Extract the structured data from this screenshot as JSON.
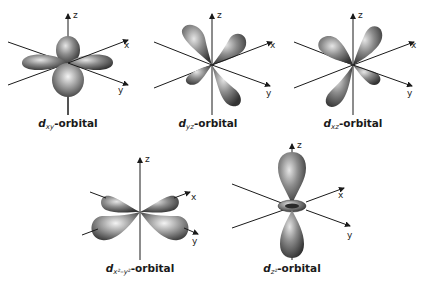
{
  "diagram": {
    "colors": {
      "lobe_dark": "#3a3a3a",
      "lobe_mid": "#7a7a7a",
      "lobe_light": "#d8d8d8",
      "axis": "#1a1a1a",
      "text": "#1a1a1a",
      "background": "#ffffff"
    },
    "axes_labels": {
      "z": "z",
      "x": "x",
      "y": "y"
    },
    "orbitals": [
      {
        "id": "dxy",
        "letter": "d",
        "subscript": "xy",
        "suffix": "-orbital"
      },
      {
        "id": "dyz",
        "letter": "d",
        "subscript": "yz",
        "suffix": "-orbital"
      },
      {
        "id": "dxz",
        "letter": "d",
        "subscript": "xz",
        "suffix": "-orbital"
      },
      {
        "id": "dx2y2",
        "letter": "d",
        "subscript": "x²–y²",
        "suffix": "-orbital"
      },
      {
        "id": "dz2",
        "letter": "d",
        "subscript": "z²",
        "suffix": "-orbital"
      }
    ]
  }
}
